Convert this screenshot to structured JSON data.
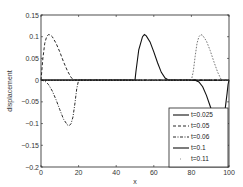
{
  "chart_data": {
    "type": "line",
    "title": "",
    "xlabel": "x",
    "ylabel": "displacement",
    "xlim": [
      0,
      100
    ],
    "ylim": [
      -0.2,
      0.15
    ],
    "xticks": [
      0,
      20,
      40,
      60,
      80,
      100
    ],
    "xtick_labels": [
      "0",
      "20",
      "40",
      "60",
      "80",
      "100"
    ],
    "yticks": [
      -0.2,
      -0.15,
      -0.1,
      -0.05,
      0,
      0.05,
      0.1,
      0.15
    ],
    "ytick_labels": [
      "-0.2",
      "-0.15",
      "-0.1",
      "-0.05",
      "0",
      "0.05",
      "0.1",
      "0.15"
    ],
    "grid": false,
    "legend_position": "lower right",
    "series": [
      {
        "name": "t=0.025",
        "style": "solid",
        "x": [
          0,
          50,
          50.5,
          52,
          54,
          55,
          56,
          58,
          60,
          62,
          64,
          66,
          68,
          100
        ],
        "y": [
          0,
          0,
          0.02,
          0.07,
          0.1,
          0.105,
          0.102,
          0.088,
          0.065,
          0.04,
          0.018,
          0.005,
          0,
          0
        ]
      },
      {
        "name": "t=0.05",
        "style": "dashed",
        "x": [
          0,
          1,
          2,
          3,
          4,
          5,
          6,
          8,
          10,
          12,
          14,
          16,
          18,
          100
        ],
        "y": [
          0,
          0.05,
          0.085,
          0.1,
          0.105,
          0.104,
          0.1,
          0.085,
          0.065,
          0.042,
          0.022,
          0.006,
          0,
          0
        ]
      },
      {
        "name": "t=0.06",
        "style": "dashdot",
        "x": [
          0,
          2,
          4,
          6,
          8,
          10,
          12,
          14,
          15,
          16,
          17,
          18,
          19,
          20,
          100
        ],
        "y": [
          0,
          -0.002,
          -0.01,
          -0.025,
          -0.045,
          -0.068,
          -0.09,
          -0.103,
          -0.105,
          -0.1,
          -0.085,
          -0.055,
          -0.02,
          0,
          0
        ]
      },
      {
        "name": "t=0.1",
        "style": "solid",
        "x": [
          0,
          82,
          84,
          86,
          88,
          90,
          92,
          94,
          95,
          96,
          97,
          98,
          99,
          99.5,
          100
        ],
        "y": [
          0,
          0,
          -0.004,
          -0.015,
          -0.035,
          -0.06,
          -0.085,
          -0.102,
          -0.105,
          -0.102,
          -0.09,
          -0.065,
          -0.03,
          -0.01,
          0
        ]
      },
      {
        "name": "t=0.11",
        "style": "dotted",
        "x": [
          0,
          80,
          81,
          82,
          83,
          84,
          85,
          86,
          88,
          90,
          92,
          94,
          96,
          100
        ],
        "y": [
          0,
          0,
          0.02,
          0.055,
          0.085,
          0.1,
          0.105,
          0.103,
          0.09,
          0.068,
          0.042,
          0.018,
          0,
          0
        ]
      }
    ]
  },
  "legend": {
    "items": [
      {
        "label": "t=0.025"
      },
      {
        "label": "t=0.05"
      },
      {
        "label": "t=0.06"
      },
      {
        "label": "t=0.1"
      },
      {
        "label": "t=0.11"
      }
    ]
  },
  "axes": {
    "xlabel": "x",
    "ylabel": "displacement"
  }
}
